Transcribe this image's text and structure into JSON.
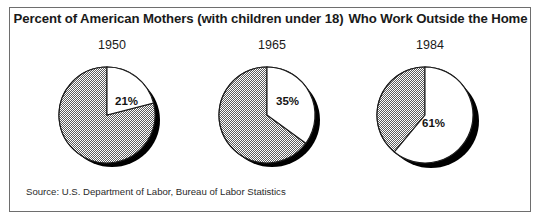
{
  "chart_data": {
    "type": "pie",
    "title_part_1": "Percent of American Mothers (with children under 18)",
    "title_part_2": "Who Work Outside the Home",
    "source": "Source: U.S. Department of Labor, Bureau of Labor Statistics",
    "xlabel": "",
    "ylabel": "",
    "legend": [],
    "grid": false,
    "slice_labels": [
      "Work Outside the Home",
      "Do Not Work Outside the Home"
    ],
    "panels": [
      {
        "year": "1950",
        "value": 21,
        "label": "21%",
        "remainder": 79,
        "slice_start_deg": 0,
        "slice_sweep_deg": 75.6
      },
      {
        "year": "1965",
        "value": 35,
        "label": "35%",
        "remainder": 65,
        "slice_start_deg": 0,
        "slice_sweep_deg": 126.0
      },
      {
        "year": "1984",
        "value": 61,
        "label": "61%",
        "remainder": 39,
        "slice_start_deg": 0,
        "slice_sweep_deg": 219.6
      }
    ],
    "categories": [
      "1950",
      "1965",
      "1984"
    ],
    "values": [
      21,
      35,
      61
    ],
    "units": "percent"
  },
  "colors": {
    "frame_border": "#6e6e6e",
    "background": "#ffffff",
    "slice_highlight": "#ffffff",
    "slice_hatch": "#8c8c8c",
    "shadow": "#000000",
    "text": "#1a1a1a"
  }
}
